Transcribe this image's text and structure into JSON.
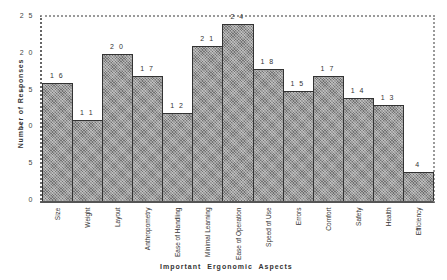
{
  "chart_data": {
    "type": "bar",
    "title": "",
    "xlabel": "Important  Ergonomic  Aspects",
    "ylabel": "Number  of  Responses",
    "ylim": [
      0,
      25
    ],
    "yticks": [
      "0",
      "5",
      "1 0",
      "1 5",
      "2 0",
      "2 5"
    ],
    "grid": false,
    "legend": null,
    "categories": [
      "Size",
      "Weight",
      "Layout",
      "Anthropometry",
      "Ease of Handling",
      "Minimal  Learning",
      "Ease of Operation",
      "Speed of Use",
      "Errors",
      "Comfort",
      "Safety",
      "Health",
      "Efficiency"
    ],
    "values": [
      16,
      11,
      20,
      17,
      12,
      21,
      24,
      18,
      15,
      17,
      14,
      13,
      4
    ],
    "value_labels": [
      "1 6",
      "1 1",
      "2 0",
      "1 7",
      "1 2",
      "2 1",
      "2 4",
      "1 8",
      "1 5",
      "1 7",
      "1 4",
      "1 3",
      "4"
    ]
  }
}
